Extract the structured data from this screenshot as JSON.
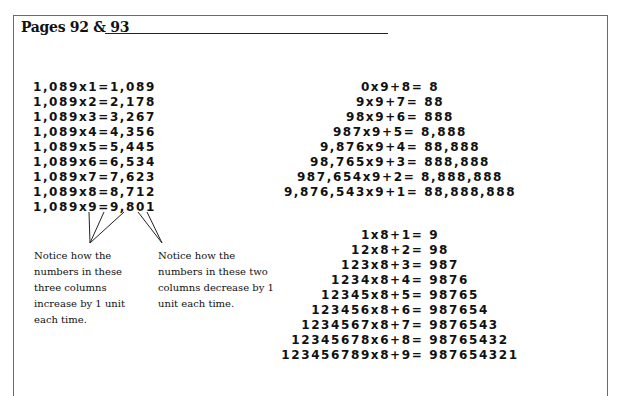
{
  "header": {
    "title": "Pages 92 & 93"
  },
  "left_column": {
    "equations": [
      "1,089x1=1,089",
      "1,089x2=2,178",
      "1,089x3=3,267",
      "1,089x4=4,356",
      "1,089x5=5,445",
      "1,089x6=6,534",
      "1,089x7=7,623",
      "1,089x8=8,712",
      "1,089x9=9,801"
    ],
    "notes": [
      "Notice how the numbers in these three columns increase by 1 unit each time.",
      "Notice how the numbers in these two columns decrease by 1 unit each time."
    ]
  },
  "pyramid_nines": {
    "equations": [
      "0x9+8= 8",
      "9x9+7= 88",
      "98x9+6= 888",
      "987x9+5= 8,888",
      "9,876x9+4= 88,888",
      "98,765x9+3= 888,888",
      "987,654x9+2= 8,888,888",
      "9,876,543x9+1= 88,888,888"
    ]
  },
  "pyramid_eights": {
    "equations": [
      "1x8+1= 9",
      "12x8+2= 98",
      "123x8+3= 987",
      "1234x8+4= 9876",
      "12345x8+5= 98765",
      "123456x8+6= 987654",
      "1234567x8+7= 9876543",
      "12345678x6+8= 98765432",
      "123456789x8+9= 987654321"
    ]
  }
}
